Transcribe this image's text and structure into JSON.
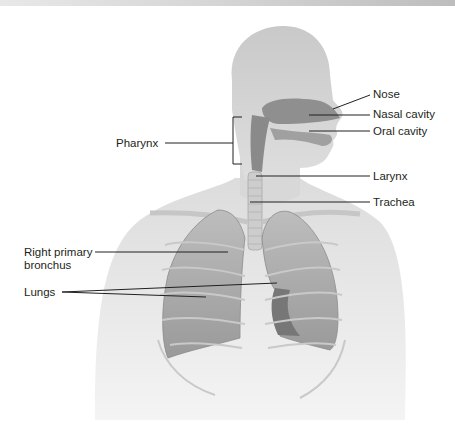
{
  "figure": {
    "labels": {
      "nose": "Nose",
      "nasal_cavity": "Nasal cavity",
      "oral_cavity": "Oral cavity",
      "pharynx": "Pharynx",
      "larynx": "Larynx",
      "trachea": "Trachea",
      "right_primary_bronchus_line1": "Right primary",
      "right_primary_bronchus_line2": "bronchus",
      "lungs": "Lungs"
    },
    "colors": {
      "background": "#ffffff",
      "body": "#e2e2e2",
      "head": "#cfcfcf",
      "airway": "#8f8f8f",
      "lung": "#a9a9a9",
      "lung_dark": "#7d7d7d",
      "leader_line": "#231f20"
    }
  }
}
